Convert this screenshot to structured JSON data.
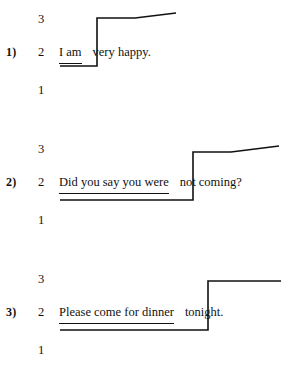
{
  "worksheet": {
    "title": "Intonation contour exercise",
    "pitch_levels": [
      "3",
      "2",
      "1"
    ],
    "items": [
      {
        "number_label": "1)",
        "levels": {
          "high": "3",
          "mid": "2",
          "low": "1"
        },
        "low_segment": "I am",
        "high_segment": "very happy.",
        "full_sentence": "I am very happy.",
        "contour_shape": "rise-then-rising-tail",
        "contour_points": "60,66 97,66 97,18 135,18 176,13"
      },
      {
        "number_label": "2)",
        "levels": {
          "high": "3",
          "mid": "2",
          "low": "1"
        },
        "low_segment": "Did you say you were",
        "high_segment": "not coming?",
        "full_sentence": "Did you say you were not coming?",
        "contour_shape": "rise-then-rising-tail",
        "contour_points": "60,70 193,70 193,22 231,22 279,16"
      },
      {
        "number_label": "3)",
        "levels": {
          "high": "3",
          "mid": "2",
          "low": "1"
        },
        "low_segment": "Please come for dinner",
        "high_segment": "tonight.",
        "full_sentence": "Please come for dinner tonight.",
        "contour_shape": "rise-then-level-tail",
        "contour_points": "60,70 208,70 208,21 281,21"
      }
    ]
  },
  "colors": {
    "ink": "#111111",
    "page": "#ffffff"
  }
}
